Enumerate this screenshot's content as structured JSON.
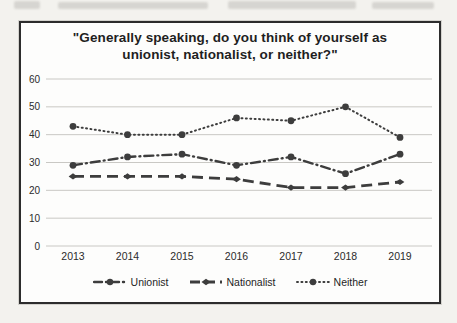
{
  "chart_data": {
    "type": "line",
    "title": "\"Generally speaking, do you think of yourself as unionist, nationalist, or neither?\"",
    "categories": [
      "2013",
      "2014",
      "2015",
      "2016",
      "2017",
      "2018",
      "2019"
    ],
    "series": [
      {
        "name": "Unionist",
        "values": [
          29,
          32,
          33,
          29,
          32,
          26,
          33
        ],
        "line_style": "dash-dot",
        "marker": "circle"
      },
      {
        "name": "Nationalist",
        "values": [
          25,
          25,
          25,
          24,
          21,
          21,
          23
        ],
        "line_style": "dashed",
        "marker": "diamond"
      },
      {
        "name": "Neither",
        "values": [
          43,
          40,
          40,
          46,
          45,
          50,
          39
        ],
        "line_style": "dotted",
        "marker": "circle"
      }
    ],
    "xlabel": "",
    "ylabel": "",
    "ylim": [
      0,
      60
    ],
    "yticks": [
      0,
      10,
      20,
      30,
      40,
      50,
      60
    ],
    "grid": true,
    "legend_position": "bottom",
    "line_color": "#3d3d3d",
    "grid_color": "#c9c8c4",
    "text_color": "#2b2b2b"
  }
}
